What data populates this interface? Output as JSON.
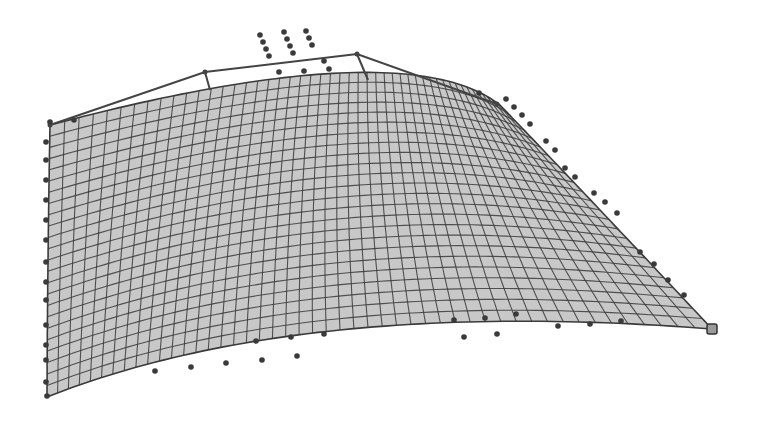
{
  "figure": {
    "background": "#ffffff",
    "surface_fill": "#c8c8c8",
    "grid_line_color": "#3a3a3a",
    "control_polygon_color": "#444444",
    "control_point_color": "#3a3a3a"
  },
  "surface": {
    "u_divisions": 48,
    "v_divisions": 24,
    "corners": {
      "top_left": [
        50,
        125
      ],
      "top_right": [
        500,
        105
      ],
      "bottom_left": [
        47,
        397
      ],
      "bottom_right": [
        712,
        329
      ]
    },
    "top_edge_mid": [
      340,
      73
    ],
    "bottom_edge_mid": [
      340,
      330
    ],
    "left_edge_mid": [
      48,
      260
    ],
    "right_edge_mid": [
      600,
      210
    ]
  },
  "control_polygon": {
    "top_edge": [
      [
        50,
        125
      ],
      [
        205,
        72
      ],
      [
        357,
        54
      ],
      [
        497,
        104
      ]
    ],
    "top_drops": [
      [
        [
          205,
          72
        ],
        [
          210,
          90
        ]
      ],
      [
        [
          357,
          54
        ],
        [
          368,
          80
        ]
      ]
    ]
  },
  "control_points": [
    [
      260,
      35
    ],
    [
      263,
      42
    ],
    [
      266,
      49
    ],
    [
      269,
      56
    ],
    [
      284,
      32
    ],
    [
      287,
      39
    ],
    [
      290,
      46
    ],
    [
      293,
      53
    ],
    [
      306,
      31
    ],
    [
      309,
      38
    ],
    [
      312,
      45
    ],
    [
      279,
      72
    ],
    [
      304,
      71
    ],
    [
      324,
      61
    ],
    [
      329,
      69
    ],
    [
      50,
      122
    ],
    [
      74,
      120
    ],
    [
      479,
      93
    ],
    [
      506,
      99
    ],
    [
      514,
      107
    ],
    [
      522,
      115
    ],
    [
      530,
      124
    ],
    [
      546,
      141
    ],
    [
      555,
      150
    ],
    [
      565,
      168
    ],
    [
      575,
      177
    ],
    [
      594,
      193
    ],
    [
      605,
      202
    ],
    [
      617,
      213
    ],
    [
      640,
      252
    ],
    [
      654,
      264
    ],
    [
      668,
      280
    ],
    [
      684,
      295
    ],
    [
      712,
      329
    ],
    [
      454,
      320
    ],
    [
      485,
      318
    ],
    [
      516,
      314
    ],
    [
      558,
      326
    ],
    [
      590,
      324
    ],
    [
      621,
      321
    ],
    [
      464,
      337
    ],
    [
      497,
      334
    ],
    [
      155,
      371
    ],
    [
      191,
      367
    ],
    [
      226,
      363
    ],
    [
      262,
      360
    ],
    [
      297,
      356
    ],
    [
      256,
      341
    ],
    [
      291,
      337
    ],
    [
      324,
      334
    ],
    [
      46,
      142
    ],
    [
      46,
      160
    ],
    [
      46,
      180
    ],
    [
      46,
      200
    ],
    [
      46,
      220
    ],
    [
      46,
      240
    ],
    [
      46,
      262
    ],
    [
      46,
      282
    ],
    [
      46,
      300
    ],
    [
      46,
      325
    ],
    [
      46,
      345
    ],
    [
      46,
      360
    ],
    [
      46,
      382
    ],
    [
      47,
      396
    ]
  ]
}
